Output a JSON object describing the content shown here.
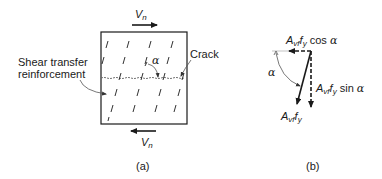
{
  "figure_a": {
    "caption": "(a)",
    "force_top": {
      "symbol": "V",
      "subscript": "n"
    },
    "force_bottom": {
      "symbol": "V",
      "subscript": "n"
    },
    "angle_label": "α",
    "crack_label": "Crack",
    "reinforcement_label_line1": "Shear transfer",
    "reinforcement_label_line2": "reinforcement"
  },
  "figure_b": {
    "caption": "(b)",
    "horizontal_component": {
      "A": "A",
      "A_sub": "vf",
      "f": "f",
      "f_sub": "y",
      "trig": "cos",
      "angle": "α"
    },
    "vertical_component": {
      "A": "A",
      "A_sub": "vf",
      "f": "f",
      "f_sub": "y",
      "trig": "sin",
      "angle": "α"
    },
    "resultant": {
      "A": "A",
      "A_sub": "vf",
      "f": "f",
      "f_sub": "y"
    },
    "angle_label": "α"
  },
  "colors": {
    "line": "#1a1a1a",
    "thin_line": "#555555",
    "crack": "#666666"
  }
}
